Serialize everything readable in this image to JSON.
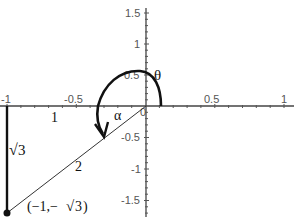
{
  "title_partial": "g",
  "axes": {
    "x_ticks": [
      {
        "value": -1,
        "label": "-1"
      },
      {
        "value": -0.5,
        "label": "-0.5"
      },
      {
        "value": 0.5,
        "label": "0.5"
      },
      {
        "value": 1,
        "label": "1"
      }
    ],
    "y_ticks": [
      {
        "value": 1.5,
        "label": "1.5"
      },
      {
        "value": 1,
        "label": "1"
      },
      {
        "value": 0.5,
        "label": "0.5"
      },
      {
        "value": 0,
        "label": "0"
      },
      {
        "value": -0.5,
        "label": "-0.5"
      },
      {
        "value": -1,
        "label": "-1"
      },
      {
        "value": -1.5,
        "label": "-1.5"
      }
    ]
  },
  "labels": {
    "theta": "θ",
    "alpha": "α",
    "adjacent": "1",
    "opposite_radical": "√",
    "opposite_value": "3",
    "hypotenuse": "2",
    "point": "(−1,−√3)",
    "point_open": "(−1,−",
    "point_radical": "√",
    "point_value": "3",
    "point_close": ")"
  },
  "colors": {
    "stroke": "#111111",
    "axis": "#444444",
    "tick_text": "#555555"
  }
}
